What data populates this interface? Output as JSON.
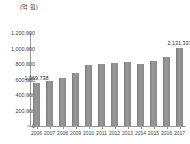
{
  "chart_data": {
    "type": "bar",
    "title": "",
    "unit_label": "(억 원)",
    "xlabel": "",
    "ylabel": "",
    "ylim": [
      0,
      1200000
    ],
    "grid": false,
    "legend": "none",
    "categories": [
      "2006",
      "2007",
      "2008",
      "2009",
      "2010",
      "2011",
      "2012",
      "2013",
      "2014",
      "2015",
      "2016",
      "2017"
    ],
    "values": [
      560000,
      575000,
      620000,
      680000,
      785000,
      800000,
      815000,
      820000,
      800000,
      840000,
      895000,
      1010000
    ],
    "ytick_labels": [
      "1,200,000",
      "1,000,000",
      "800,000",
      "600,000",
      "400,000",
      "200,000",
      "0"
    ],
    "ytick_values": [
      1200000,
      1000000,
      800000,
      600000,
      400000,
      200000,
      0
    ],
    "annotations": [
      {
        "category": "2006",
        "text": "1,069,738"
      },
      {
        "category": "2017",
        "text": "2,131,337"
      }
    ],
    "bar_color": "#8b8b8b",
    "axis_color": "#9a9a9a",
    "text_color": "#3d3d3d"
  }
}
